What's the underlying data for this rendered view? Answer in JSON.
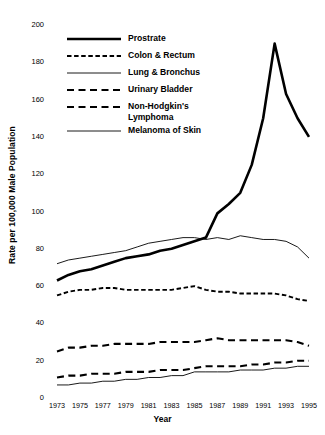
{
  "chart_data": {
    "type": "line",
    "title": "",
    "xlabel": "Year",
    "ylabel": "Rate per 100,000 Male Population",
    "xlim": [
      1973,
      1995
    ],
    "ylim": [
      0,
      200
    ],
    "ytick_step": 20,
    "grid": false,
    "legend_position": "upper-left-inside",
    "x": [
      1973,
      1974,
      1975,
      1976,
      1977,
      1978,
      1979,
      1980,
      1981,
      1982,
      1983,
      1984,
      1985,
      1986,
      1987,
      1988,
      1989,
      1990,
      1991,
      1992,
      1993,
      1994,
      1995
    ],
    "xticks": [
      "1973",
      "1975",
      "1977",
      "1979",
      "1981",
      "1983",
      "1985",
      "1987",
      "1989",
      "1991",
      "1993",
      "1995"
    ],
    "yticks": [
      "0",
      "20",
      "40",
      "60",
      "80",
      "100",
      "120",
      "140",
      "160",
      "180",
      "200"
    ],
    "series": [
      {
        "name": "Prostrate",
        "style": "solid-thick",
        "color": "#000000",
        "values": [
          63,
          66,
          68,
          69,
          71,
          73,
          75,
          76,
          77,
          79,
          80,
          82,
          84,
          86,
          99,
          104,
          110,
          125,
          150,
          190,
          163,
          150,
          140
        ]
      },
      {
        "name": "Colon & Rectum",
        "style": "dashed-fine",
        "color": "#000000",
        "values": [
          55,
          57,
          58,
          58,
          59,
          59,
          58,
          58,
          58,
          58,
          58,
          59,
          60,
          58,
          57,
          57,
          56,
          56,
          56,
          56,
          55,
          53,
          52
        ]
      },
      {
        "name": "Lung & Bronchus",
        "style": "solid-thin",
        "color": "#000000",
        "values": [
          72,
          74,
          75,
          76,
          77,
          78,
          79,
          81,
          83,
          84,
          85,
          86,
          86,
          85,
          86,
          85,
          87,
          86,
          85,
          85,
          84,
          81,
          75
        ]
      },
      {
        "name": "Urinary Bladder",
        "style": "dashed-coarse",
        "color": "#000000",
        "values": [
          25,
          27,
          27,
          28,
          28,
          29,
          29,
          29,
          29,
          30,
          30,
          30,
          30,
          31,
          32,
          31,
          31,
          31,
          31,
          31,
          31,
          30,
          28
        ]
      },
      {
        "name": "Non-Hodgkin's\nLymphoma",
        "style": "dashed-coarse",
        "color": "#000000",
        "values": [
          11,
          12,
          12,
          13,
          13,
          13,
          14,
          14,
          14,
          15,
          15,
          15,
          16,
          17,
          17,
          17,
          17,
          18,
          18,
          19,
          19,
          20,
          20
        ]
      },
      {
        "name": "Melanoma of Skin",
        "style": "solid-thin",
        "color": "#000000",
        "values": [
          7,
          7,
          8,
          8,
          9,
          9,
          10,
          10,
          11,
          11,
          12,
          12,
          14,
          14,
          14,
          14,
          15,
          15,
          15,
          16,
          16,
          17,
          17
        ]
      }
    ]
  },
  "axes": {
    "x_title": "Year",
    "y_title": "Rate per 100,000 Male Population"
  },
  "legend": {
    "items": [
      {
        "label": "Prostrate",
        "style": "solid-thick"
      },
      {
        "label": "Colon & Rectum",
        "style": "dashed-fine"
      },
      {
        "label": "Lung & Bronchus",
        "style": "solid-thin"
      },
      {
        "label": "Urinary Bladder",
        "style": "dashed-coarse"
      },
      {
        "label": "Non-Hodgkin's\nLymphoma",
        "style": "dashed-coarse"
      },
      {
        "label": "Melanoma of Skin",
        "style": "solid-thin"
      }
    ]
  },
  "colors": {
    "ink": "#000000",
    "background": "#ffffff"
  }
}
